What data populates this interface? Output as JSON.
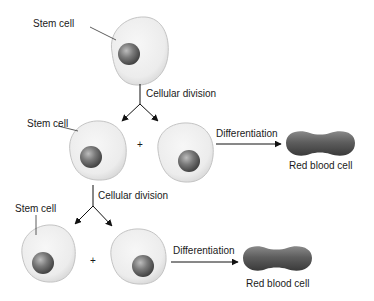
{
  "diagram": {
    "type": "stem-cell-differentiation",
    "labels": {
      "stem_cell": "Stem cell",
      "cellular_division": "Cellular division",
      "differentiation": "Differentiation",
      "red_blood_cell": "Red blood cell",
      "plus": "+"
    },
    "rows": [
      {
        "stage": "original",
        "stem_cell_label": "Stem cell",
        "arrow_label": "Cellular division"
      },
      {
        "stage": "first-division",
        "stem_cell_label": "Stem cell",
        "plus": "+",
        "differentiation_label": "Differentiation",
        "product_label": "Red blood cell",
        "next_arrow_label": "Cellular division"
      },
      {
        "stage": "second-division",
        "stem_cell_label": "Stem cell",
        "plus": "+",
        "differentiation_label": "Differentiation",
        "product_label": "Red blood cell"
      }
    ],
    "colors": {
      "cell_fill": "#ececec",
      "cell_stroke": "#bdbdbd",
      "nucleus": "#707070",
      "rbc": "#6a6a6a",
      "text": "#1a1a1a",
      "arrow": "#111111"
    }
  }
}
